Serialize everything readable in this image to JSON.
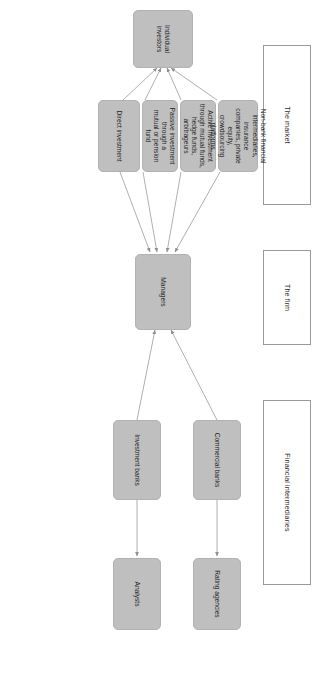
{
  "figure": {
    "orientation": "rotated-90-clockwise",
    "background_color": "#ffffff",
    "node_fill_color": "#bfbfbf",
    "node_border_color": "#b2b2b2",
    "edge_color": "#9a9a9a",
    "header_border_color": "#9a9a9a",
    "text_color": "#1f1f1f"
  },
  "section_headers": [
    {
      "id": "market",
      "label": "The market"
    },
    {
      "id": "firm",
      "label": "The firm"
    },
    {
      "id": "intermediaries",
      "label": "Financial intermediaries"
    }
  ],
  "nodes": [
    {
      "id": "individual-investors",
      "label": "Individual investors",
      "section": "market"
    },
    {
      "id": "direct-investment",
      "label": "Direct investment",
      "section": "market"
    },
    {
      "id": "passive-investment",
      "label": "Passive investment\nthrough a\nmutual or pension\nfund",
      "section": "market"
    },
    {
      "id": "active-investment",
      "label": "Active investment\nthrough mutual funds,\nhedge funds,\narbitrageurs",
      "section": "market"
    },
    {
      "id": "non-bank-intermediaries",
      "label": "Non-bank financial\nintermediaries, insurance\ncompanies, private equity,\ncrowdsourcing platforms",
      "section": "market"
    },
    {
      "id": "managers",
      "label": "Managers",
      "section": "firm"
    },
    {
      "id": "investment-banks",
      "label": "Investment banks",
      "section": "intermediaries"
    },
    {
      "id": "commercial-banks",
      "label": "Commercial banks",
      "section": "intermediaries"
    },
    {
      "id": "analysts",
      "label": "Analysts",
      "section": "intermediaries"
    },
    {
      "id": "rating-agencies",
      "label": "Rating agencies",
      "section": "intermediaries"
    }
  ],
  "edges": [
    {
      "from": "direct-investment",
      "to": "individual-investors"
    },
    {
      "from": "passive-investment",
      "to": "individual-investors"
    },
    {
      "from": "active-investment",
      "to": "individual-investors"
    },
    {
      "from": "non-bank-intermediaries",
      "to": "individual-investors"
    },
    {
      "from": "direct-investment",
      "to": "managers"
    },
    {
      "from": "passive-investment",
      "to": "managers"
    },
    {
      "from": "active-investment",
      "to": "managers"
    },
    {
      "from": "non-bank-intermediaries",
      "to": "managers"
    },
    {
      "from": "investment-banks",
      "to": "managers"
    },
    {
      "from": "commercial-banks",
      "to": "managers"
    },
    {
      "from": "investment-banks",
      "to": "analysts"
    },
    {
      "from": "commercial-banks",
      "to": "rating-agencies"
    }
  ]
}
